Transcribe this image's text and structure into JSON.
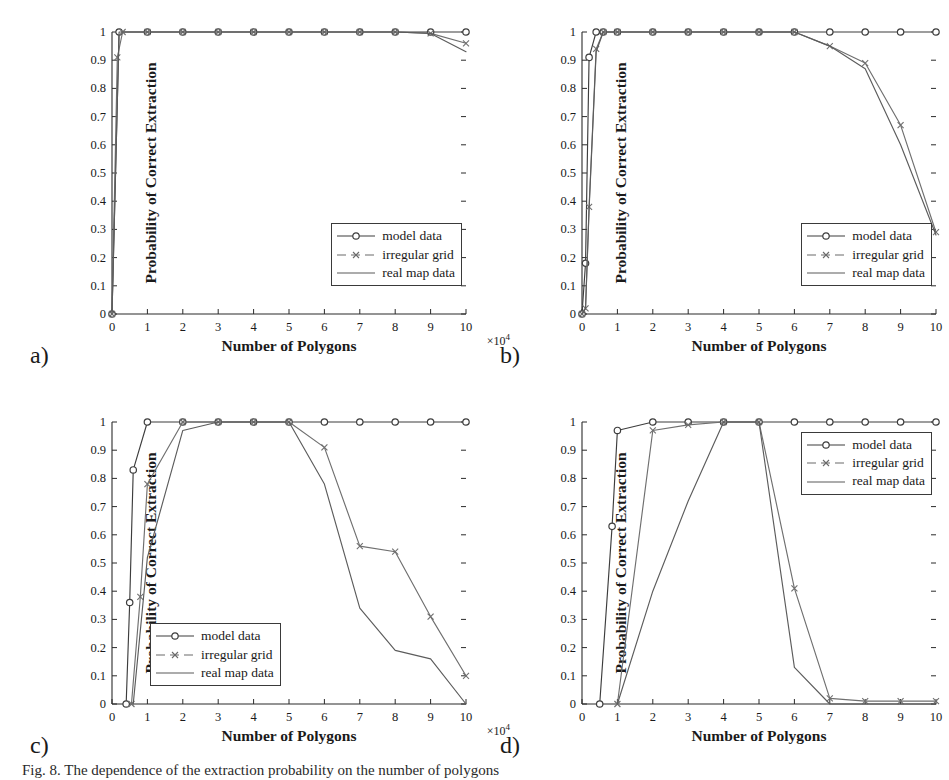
{
  "figure": {
    "panel_letters": [
      "a)",
      "b)",
      "c)",
      "d)"
    ],
    "caption": "Fig. 8. The dependence of the extraction probability on the number of polygons"
  },
  "axis": {
    "ylabel": "Probability of Correct Extraction",
    "xlabel": "Number of Polygons",
    "exponent": "×10",
    "exponent_sup": "4",
    "yticks": [
      "0",
      "0.1",
      "0.2",
      "0.3",
      "0.4",
      "0.5",
      "0.6",
      "0.7",
      "0.8",
      "0.9",
      "1"
    ],
    "xticks": [
      "0",
      "1",
      "2",
      "3",
      "4",
      "5",
      "6",
      "7",
      "8",
      "9",
      "10"
    ]
  },
  "legend": {
    "items": [
      {
        "label": "model data",
        "marker": "circle-marker",
        "color": "#3d3d3d"
      },
      {
        "label": "irregular grid",
        "marker": "x-marker",
        "color": "#6a6a6a"
      },
      {
        "label": "real map data",
        "marker": "line-marker",
        "color": "#5a5a5a"
      }
    ]
  },
  "chart_data": [
    {
      "type": "line",
      "panel": "a)",
      "title": "",
      "xlabel": "Number of Polygons",
      "ylabel": "Probability of Correct Extraction",
      "xlim": [
        0,
        10
      ],
      "ylim": [
        0,
        1
      ],
      "x_scale_note": "×10^4",
      "grid": false,
      "legend_position": "lower-right",
      "series": [
        {
          "name": "model data",
          "x": [
            0,
            0.2,
            1,
            2,
            3,
            4,
            5,
            6,
            7,
            8,
            9,
            10
          ],
          "y": [
            0,
            1,
            1,
            1,
            1,
            1,
            1,
            1,
            1,
            1,
            1,
            1
          ]
        },
        {
          "name": "irregular grid",
          "x": [
            0,
            0.15,
            0.3,
            1,
            2,
            3,
            4,
            5,
            6,
            7,
            8,
            9,
            10
          ],
          "y": [
            0,
            0.91,
            1,
            1,
            1,
            1,
            1,
            1,
            1,
            1,
            1,
            0.995,
            0.96
          ]
        },
        {
          "name": "real map data",
          "x": [
            0,
            0.2,
            1,
            2,
            3,
            4,
            5,
            6,
            7,
            8,
            9,
            10
          ],
          "y": [
            0,
            1,
            1,
            1,
            1,
            1,
            1,
            1,
            1,
            1,
            0.995,
            0.93
          ]
        }
      ]
    },
    {
      "type": "line",
      "panel": "b)",
      "title": "",
      "xlabel": "Number of Polygons",
      "ylabel": "Probability of Correct Extraction",
      "xlim": [
        0,
        10
      ],
      "ylim": [
        0,
        1
      ],
      "x_scale_note": "×10^4",
      "grid": false,
      "legend_position": "lower-right",
      "series": [
        {
          "name": "model data",
          "x": [
            0,
            0.1,
            0.2,
            0.4,
            0.6,
            1,
            2,
            3,
            4,
            5,
            6,
            7,
            8,
            9,
            10
          ],
          "y": [
            0,
            0.18,
            0.91,
            1,
            1,
            1,
            1,
            1,
            1,
            1,
            1,
            1,
            1,
            1,
            1
          ]
        },
        {
          "name": "irregular grid",
          "x": [
            0,
            0.1,
            0.2,
            0.4,
            0.6,
            1,
            2,
            3,
            4,
            5,
            6,
            7,
            8,
            9,
            10
          ],
          "y": [
            0,
            0.02,
            0.38,
            0.94,
            1,
            1,
            1,
            1,
            1,
            1,
            1,
            0.95,
            0.89,
            0.67,
            0.29
          ]
        },
        {
          "name": "real map data",
          "x": [
            0,
            0.1,
            0.2,
            0.4,
            0.6,
            1,
            2,
            3,
            4,
            5,
            6,
            7,
            8,
            9,
            10
          ],
          "y": [
            0,
            0.02,
            0.37,
            0.93,
            1,
            1,
            1,
            1,
            1,
            1,
            1,
            0.95,
            0.87,
            0.6,
            0.28
          ]
        }
      ]
    },
    {
      "type": "line",
      "panel": "c)",
      "title": "",
      "xlabel": "Number of Polygons",
      "ylabel": "Probability of Correct Extraction",
      "xlim": [
        0,
        10
      ],
      "ylim": [
        0,
        1
      ],
      "x_scale_note": "×10^4",
      "grid": false,
      "legend_position": "lower-left",
      "series": [
        {
          "name": "model data",
          "x": [
            0.4,
            0.5,
            0.6,
            1,
            2,
            3,
            4,
            5,
            6,
            7,
            8,
            9,
            10
          ],
          "y": [
            0,
            0.36,
            0.83,
            1,
            1,
            1,
            1,
            1,
            1,
            1,
            1,
            1,
            1
          ]
        },
        {
          "name": "irregular grid",
          "x": [
            0.55,
            0.8,
            1,
            2,
            3,
            4,
            5,
            6,
            7,
            8,
            9,
            10
          ],
          "y": [
            0,
            0.38,
            0.78,
            1,
            1,
            1,
            1,
            0.91,
            0.56,
            0.54,
            0.31,
            0.1
          ]
        },
        {
          "name": "real map data",
          "x": [
            0.6,
            1,
            2,
            3,
            4,
            5,
            6,
            7,
            8,
            9,
            10
          ],
          "y": [
            0,
            0.52,
            0.97,
            1,
            1,
            1,
            0.78,
            0.34,
            0.19,
            0.16,
            0.0
          ]
        }
      ]
    },
    {
      "type": "line",
      "panel": "d)",
      "title": "",
      "xlabel": "Number of Polygons",
      "ylabel": "Probability of Correct Extraction",
      "xlim": [
        0,
        10
      ],
      "ylim": [
        0,
        1
      ],
      "x_scale_note": "×10^4",
      "grid": false,
      "legend_position": "upper-right",
      "series": [
        {
          "name": "model data",
          "x": [
            0.5,
            0.85,
            1,
            2,
            3,
            4,
            5,
            6,
            7,
            8,
            9,
            10
          ],
          "y": [
            0,
            0.63,
            0.97,
            1,
            1,
            1,
            1,
            1,
            1,
            1,
            1,
            1
          ]
        },
        {
          "name": "irregular grid",
          "x": [
            1,
            2,
            3,
            4,
            5,
            6,
            7,
            8,
            9,
            10
          ],
          "y": [
            0,
            0.97,
            0.99,
            1,
            1,
            0.41,
            0.02,
            0.01,
            0.01,
            0.01
          ]
        },
        {
          "name": "real map data",
          "x": [
            1,
            2,
            3,
            4,
            5,
            6,
            7,
            8,
            9,
            10
          ],
          "y": [
            0,
            0.4,
            0.72,
            1,
            1,
            0.13,
            0.0,
            0.0,
            0.0,
            0.0
          ]
        }
      ]
    }
  ]
}
